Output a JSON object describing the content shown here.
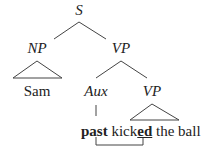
{
  "tree": {
    "root": "S",
    "np": "NP",
    "vp": "VP",
    "np_leaf": "Sam",
    "aux": "Aux",
    "vp2": "VP"
  },
  "sentence": {
    "tense": "past",
    "verb_stem": "kick",
    "verb_suffix": "ed",
    "rest": "the ball"
  },
  "colors": {
    "line": "#444444",
    "text": "#222222"
  }
}
